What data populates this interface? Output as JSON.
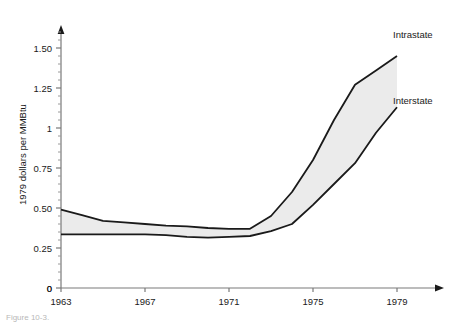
{
  "chart_data": {
    "type": "line",
    "title": "",
    "subtitle": "",
    "xlabel": "",
    "ylabel": "1979 dollars per MMBtu",
    "xlim": [
      1963,
      1979
    ],
    "ylim": [
      0,
      1.6
    ],
    "grid": false,
    "legend_position": "right-inline-labels",
    "fill_between_series": true,
    "band_fill_color": "#ebebeb",
    "line_color": "#1a1a1a",
    "axis_color": "#7a7a7a",
    "x_tick_labels": [
      "1963",
      "1967",
      "1971",
      "1975",
      "1979"
    ],
    "x_tick_values": [
      1963,
      1967,
      1971,
      1975,
      1979
    ],
    "y_tick_labels": [
      "0",
      "0.25",
      "0.50",
      "0.75",
      "1",
      "1.25",
      "1.50"
    ],
    "y_tick_values": [
      0,
      0.25,
      0.5,
      0.75,
      1,
      1.25,
      1.5
    ],
    "y_minor_tick_step": 0.05,
    "origin_label": "0",
    "x": [
      1963,
      1964,
      1965,
      1966,
      1967,
      1968,
      1969,
      1970,
      1971,
      1972,
      1973,
      1974,
      1975,
      1976,
      1977,
      1978,
      1979
    ],
    "series": [
      {
        "name": "Intrastate",
        "label": "Intrastate",
        "values": [
          0.49,
          0.455,
          0.42,
          0.41,
          0.4,
          0.39,
          0.385,
          0.375,
          0.37,
          0.37,
          0.45,
          0.6,
          0.8,
          1.05,
          1.27,
          1.36,
          1.45
        ]
      },
      {
        "name": "Interstate",
        "label": "Interstate",
        "values": [
          0.335,
          0.335,
          0.335,
          0.335,
          0.335,
          0.33,
          0.32,
          0.315,
          0.32,
          0.325,
          0.355,
          0.4,
          0.52,
          0.65,
          0.78,
          0.97,
          1.13
        ]
      }
    ]
  },
  "caption": {
    "text": "Figure 10-3."
  }
}
